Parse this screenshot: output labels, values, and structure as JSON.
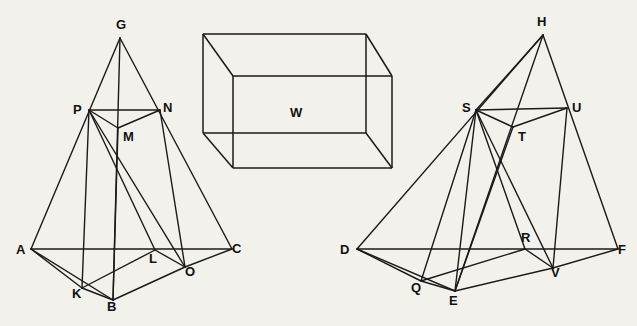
{
  "figure": {
    "background_color": "#f3f1ec",
    "ink_color": "#1a1a1a"
  },
  "left_pyramid": {
    "name": "left-pyramid",
    "apex_label": "G",
    "vertices": [
      {
        "id": "G",
        "label": "G",
        "x": 120,
        "y": 38,
        "label_x": 116,
        "label_y": 18
      },
      {
        "id": "P",
        "label": "P",
        "x": 89,
        "y": 110,
        "label_x": 73,
        "label_y": 103
      },
      {
        "id": "N",
        "label": "N",
        "x": 160,
        "y": 110,
        "label_x": 163,
        "label_y": 101
      },
      {
        "id": "M",
        "label": "M",
        "x": 118,
        "y": 128,
        "label_x": 123,
        "label_y": 130
      },
      {
        "id": "A",
        "label": "A",
        "x": 31,
        "y": 249,
        "label_x": 16,
        "label_y": 243
      },
      {
        "id": "C",
        "label": "C",
        "x": 232,
        "y": 249,
        "label_x": 232,
        "label_y": 242
      },
      {
        "id": "L",
        "label": "L",
        "x": 155,
        "y": 250,
        "label_x": 149,
        "label_y": 252
      },
      {
        "id": "O",
        "label": "O",
        "x": 185,
        "y": 267,
        "label_x": 185,
        "label_y": 265
      },
      {
        "id": "K",
        "label": "K",
        "x": 82,
        "y": 288,
        "label_x": 72,
        "label_y": 287
      },
      {
        "id": "B",
        "label": "B",
        "x": 113,
        "y": 300,
        "label_x": 107,
        "label_y": 300
      }
    ],
    "edges": [
      {
        "from": "A",
        "to": "G"
      },
      {
        "from": "C",
        "to": "G"
      },
      {
        "from": "A",
        "to": "C"
      },
      {
        "from": "G",
        "to": "B"
      },
      {
        "from": "A",
        "to": "K"
      },
      {
        "from": "A",
        "to": "B"
      },
      {
        "from": "K",
        "to": "B"
      },
      {
        "from": "B",
        "to": "O"
      },
      {
        "from": "O",
        "to": "C"
      },
      {
        "from": "K",
        "to": "L"
      },
      {
        "from": "L",
        "to": "O"
      },
      {
        "from": "P",
        "to": "N"
      },
      {
        "from": "P",
        "to": "M"
      },
      {
        "from": "M",
        "to": "N"
      },
      {
        "from": "P",
        "to": "L"
      },
      {
        "from": "P",
        "to": "O"
      },
      {
        "from": "P",
        "to": "K"
      },
      {
        "from": "M",
        "to": "B"
      },
      {
        "from": "N",
        "to": "O"
      }
    ]
  },
  "right_pyramid": {
    "name": "right-pyramid",
    "apex_label": "H",
    "vertices": [
      {
        "id": "H",
        "label": "H",
        "x": 543,
        "y": 35,
        "label_x": 537,
        "label_y": 15
      },
      {
        "id": "S",
        "label": "S",
        "x": 476,
        "y": 110,
        "label_x": 462,
        "label_y": 101
      },
      {
        "id": "U",
        "label": "U",
        "x": 567,
        "y": 108,
        "label_x": 572,
        "label_y": 101
      },
      {
        "id": "T",
        "label": "T",
        "x": 513,
        "y": 127,
        "label_x": 518,
        "label_y": 130
      },
      {
        "id": "D",
        "label": "D",
        "x": 357,
        "y": 249,
        "label_x": 340,
        "label_y": 243
      },
      {
        "id": "F",
        "label": "F",
        "x": 618,
        "y": 249,
        "label_x": 618,
        "label_y": 243
      },
      {
        "id": "R",
        "label": "R",
        "x": 525,
        "y": 249,
        "label_x": 521,
        "label_y": 231
      },
      {
        "id": "V",
        "label": "V",
        "x": 553,
        "y": 268,
        "label_x": 551,
        "label_y": 266
      },
      {
        "id": "Q",
        "label": "Q",
        "x": 421,
        "y": 281,
        "label_x": 411,
        "label_y": 281
      },
      {
        "id": "E",
        "label": "E",
        "x": 455,
        "y": 291,
        "label_x": 449,
        "label_y": 294
      }
    ],
    "edges": [
      {
        "from": "D",
        "to": "H"
      },
      {
        "from": "F",
        "to": "H"
      },
      {
        "from": "D",
        "to": "F"
      },
      {
        "from": "H",
        "to": "E"
      },
      {
        "from": "D",
        "to": "Q"
      },
      {
        "from": "D",
        "to": "E"
      },
      {
        "from": "Q",
        "to": "E"
      },
      {
        "from": "E",
        "to": "V"
      },
      {
        "from": "V",
        "to": "F"
      },
      {
        "from": "Q",
        "to": "R"
      },
      {
        "from": "R",
        "to": "V"
      },
      {
        "from": "S",
        "to": "U"
      },
      {
        "from": "S",
        "to": "T"
      },
      {
        "from": "T",
        "to": "U"
      },
      {
        "from": "S",
        "to": "R"
      },
      {
        "from": "S",
        "to": "V"
      },
      {
        "from": "S",
        "to": "Q"
      },
      {
        "from": "S",
        "to": "E"
      },
      {
        "from": "T",
        "to": "E"
      },
      {
        "from": "U",
        "to": "V"
      },
      {
        "from": "S",
        "to": "H"
      }
    ]
  },
  "box": {
    "name": "rectangular-prism",
    "label": "W",
    "label_x": 290,
    "label_y": 106,
    "front": {
      "x1": 233,
      "y1": 76,
      "x2": 392,
      "y2": 168
    },
    "back": {
      "x1": 203,
      "y1": 34,
      "x2": 366,
      "y2": 133
    },
    "edges": [
      {
        "from": "front-tl",
        "to": "front-tr"
      },
      {
        "from": "front-tr",
        "to": "front-br"
      },
      {
        "from": "front-br",
        "to": "front-bl"
      },
      {
        "from": "front-bl",
        "to": "front-tl"
      },
      {
        "from": "back-tl",
        "to": "back-tr"
      },
      {
        "from": "back-tr",
        "to": "back-br"
      },
      {
        "from": "back-br",
        "to": "back-bl"
      },
      {
        "from": "back-bl",
        "to": "back-tl"
      },
      {
        "from": "front-tl",
        "to": "back-tl"
      },
      {
        "from": "front-tr",
        "to": "back-tr"
      },
      {
        "from": "front-br",
        "to": "back-br"
      },
      {
        "from": "front-bl",
        "to": "back-bl"
      }
    ]
  }
}
